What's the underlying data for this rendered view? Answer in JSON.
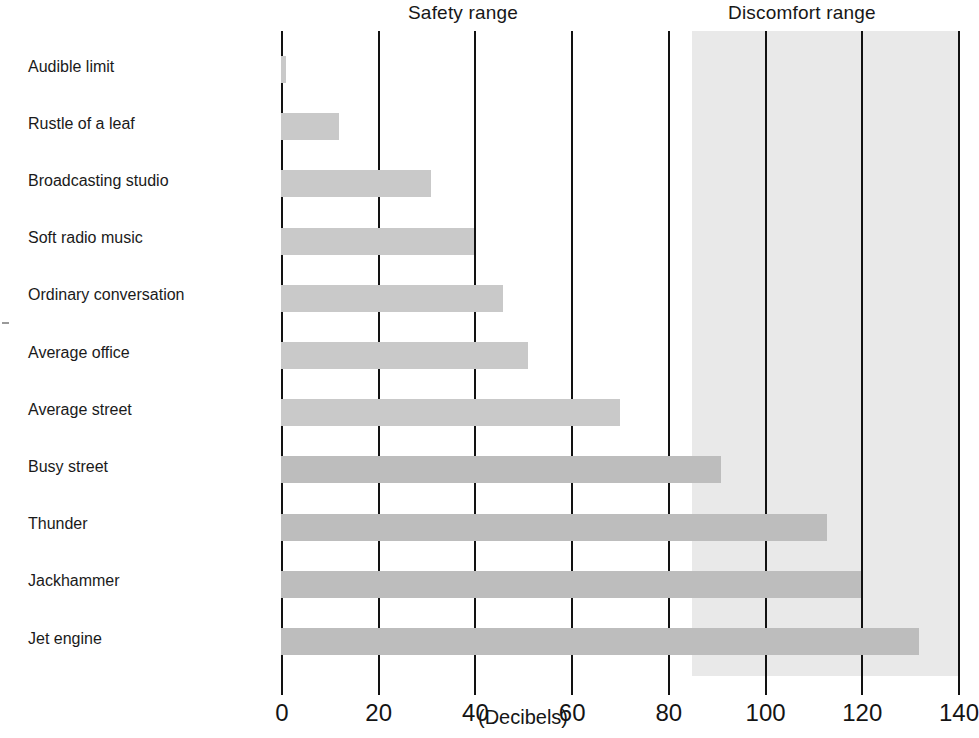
{
  "chart_data": {
    "type": "bar",
    "orientation": "horizontal",
    "title": "",
    "xlabel": "(Decibels)",
    "ylabel": "",
    "xlim": [
      0,
      140
    ],
    "xticks": [
      0,
      20,
      40,
      60,
      80,
      100,
      120,
      140
    ],
    "xtick_labels": [
      "0",
      "20",
      "40",
      "60",
      "80",
      "100",
      "120",
      "140"
    ],
    "grid": true,
    "grid_axis": "x",
    "legend": "none",
    "categories": [
      "Audible limit",
      "Rustle of a leaf",
      "Broadcasting studio",
      "Soft radio music",
      "Ordinary conversation",
      "Average office",
      "Average street",
      "Busy street",
      "Thunder",
      "Jackhammer",
      "Jet engine"
    ],
    "values": [
      1,
      12,
      31,
      40,
      46,
      51,
      70,
      91,
      113,
      120,
      132
    ],
    "bar_color": "#c9c9c9",
    "annotations": [
      {
        "name": "safety-range",
        "text": "Safety range",
        "position": "top",
        "span": [
          0,
          85
        ]
      },
      {
        "name": "discomfort-range",
        "text": "Discomfort range",
        "position": "top",
        "span": [
          85,
          140
        ],
        "shaded": true,
        "shade_color": "#e9e9e9"
      }
    ]
  },
  "figure": {
    "safety_range_label": "Safety range",
    "discomfort_range_label": "Discomfort range",
    "axis_title": "(Decibels)"
  }
}
